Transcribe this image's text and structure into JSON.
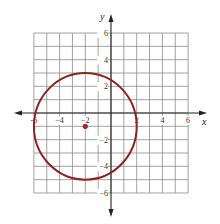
{
  "chart_data": {
    "type": "scatter",
    "title": "",
    "xlabel": "x",
    "ylabel": "y",
    "xlim": [
      -6,
      6
    ],
    "ylim": [
      -6,
      6
    ],
    "grid": true,
    "grid_step": 1,
    "x_ticks": [
      -6,
      -4,
      -2,
      2,
      4,
      6
    ],
    "y_ticks": [
      6,
      4,
      2,
      -2,
      -4,
      -6
    ],
    "x_tick_labels": [
      "-6",
      "−4",
      "−2",
      "2",
      "4",
      "6"
    ],
    "y_tick_labels": [
      "6",
      "4",
      "2",
      "−2",
      "−4",
      "−6"
    ],
    "series": [
      {
        "name": "circle",
        "kind": "circle",
        "center": [
          -2,
          -1
        ],
        "radius": 4,
        "equation": "(x + 2)^2 + (y + 1)^2 = 16",
        "color": "#8b2323"
      },
      {
        "name": "center point",
        "kind": "point",
        "points": [
          [
            -2,
            -1
          ]
        ],
        "color": "#b22222"
      }
    ],
    "legend": null
  },
  "colors": {
    "grid": "#8a8a8a",
    "axis": "#222222",
    "circle": "#8b2323",
    "point": "#b22222"
  },
  "layout": {
    "origin_px": [
      111,
      113
    ],
    "unit_px_x": 12.85,
    "unit_px_y": 13.33
  }
}
